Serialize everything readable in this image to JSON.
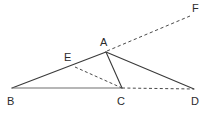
{
  "figure": {
    "type": "geometry-diagram",
    "background_color": "#ffffff",
    "stroke_color": "#3a3a3a",
    "label_color": "#2b2b2b",
    "points": [
      {
        "name": "A",
        "label": "A",
        "x": 106,
        "y": 52,
        "label_x": 100,
        "label_y": 37
      },
      {
        "name": "B",
        "label": "B",
        "x": 12,
        "y": 88,
        "label_x": 7,
        "label_y": 96
      },
      {
        "name": "C",
        "label": "C",
        "x": 122,
        "y": 88,
        "label_x": 117,
        "label_y": 96
      },
      {
        "name": "D",
        "label": "D",
        "x": 194,
        "y": 89,
        "label_x": 191,
        "label_y": 96
      },
      {
        "name": "E",
        "label": "E",
        "x": 75,
        "y": 67,
        "label_x": 64,
        "label_y": 52
      },
      {
        "name": "F",
        "label": "F",
        "x": 190,
        "y": 16,
        "label_x": 192,
        "label_y": 3
      }
    ],
    "segments": [
      {
        "name": "segment-BA",
        "from": "B",
        "to": "A",
        "style": "solid",
        "x1": 12,
        "y1": 88,
        "x2": 106,
        "y2": 52
      },
      {
        "name": "segment-BC",
        "from": "B",
        "to": "C",
        "style": "solid",
        "x1": 12,
        "y1": 88,
        "x2": 122,
        "y2": 88
      },
      {
        "name": "segment-AC",
        "from": "A",
        "to": "C",
        "style": "solid",
        "x1": 106,
        "y1": 52,
        "x2": 122,
        "y2": 88
      },
      {
        "name": "segment-AD",
        "from": "A",
        "to": "D",
        "style": "solid",
        "x1": 106,
        "y1": 52,
        "x2": 194,
        "y2": 89
      },
      {
        "name": "segment-EC",
        "from": "E",
        "to": "C",
        "style": "dashed",
        "x1": 75,
        "y1": 67,
        "x2": 122,
        "y2": 88
      },
      {
        "name": "segment-CD",
        "from": "C",
        "to": "D",
        "style": "dashed",
        "x1": 122,
        "y1": 88,
        "x2": 194,
        "y2": 89
      },
      {
        "name": "segment-AF",
        "from": "A",
        "to": "F",
        "style": "dashed",
        "x1": 107,
        "y1": 51,
        "x2": 190,
        "y2": 16
      }
    ]
  }
}
